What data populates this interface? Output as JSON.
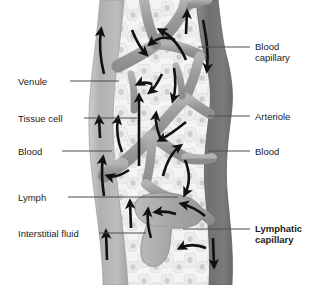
{
  "figure": {
    "background_color": "#ffffff",
    "width": 319,
    "height": 285
  },
  "palette": {
    "venule_fill": "#b3b3b3",
    "venule_edge": "#9a9a9a",
    "arteriole_fill": "#7d7d7d",
    "arteriole_edge": "#6a6a6a",
    "capillary_fill": "#9e9e9e",
    "lymphatic_fill": "#a8a8a8",
    "tissue_fill": "#f2f2f2",
    "tissue_edge": "#d8d8d8",
    "nucleus_fill": "#c9c9c9",
    "arrow_color": "#111111",
    "leader_color": "#4d4d4d",
    "text_color": "#1b1b1b"
  },
  "labels": {
    "left": [
      {
        "id": "venule",
        "text": "Venule",
        "bold": false,
        "x": 18,
        "y": 76,
        "leader_x1": 70,
        "leader_x2": 119,
        "leader_y": 81
      },
      {
        "id": "tissue-cell",
        "text": "Tissue cell",
        "bold": false,
        "x": 18,
        "y": 113,
        "leader_x1": 84,
        "leader_x2": 135,
        "leader_y": 118
      },
      {
        "id": "blood-left",
        "text": "Blood",
        "bold": false,
        "x": 18,
        "y": 146,
        "leader_x1": 62,
        "leader_x2": 112,
        "leader_y": 151
      },
      {
        "id": "lymph",
        "text": "Lymph",
        "bold": false,
        "x": 18,
        "y": 192,
        "leader_x1": 68,
        "leader_x2": 178,
        "leader_y": 197
      },
      {
        "id": "interstitial-fluid",
        "text": "Interstitial fluid",
        "bold": false,
        "x": 18,
        "y": 228,
        "leader_x1": 99,
        "leader_x2": 146,
        "leader_y": 233
      }
    ],
    "right": [
      {
        "id": "blood-capillary",
        "text": "Blood\ncapillary",
        "bold": false,
        "x": 255,
        "y": 41,
        "leader_x1": 198,
        "leader_x2": 248,
        "leader_y": 47
      },
      {
        "id": "arteriole",
        "text": "Arteriole",
        "bold": false,
        "x": 255,
        "y": 111,
        "leader_x1": 206,
        "leader_x2": 248,
        "leader_y": 116
      },
      {
        "id": "blood-right",
        "text": "Blood",
        "bold": false,
        "x": 255,
        "y": 146,
        "leader_x1": 206,
        "leader_x2": 248,
        "leader_y": 151
      },
      {
        "id": "lymphatic-capillary",
        "text": "Lymphatic\ncapillary",
        "bold": true,
        "x": 255,
        "y": 223,
        "leader_x1": 183,
        "leader_x2": 248,
        "leader_y": 229
      }
    ]
  },
  "flow_arrows": {
    "description": "Black directional arrows showing blood flow in vessels, fluid movement into interstitial space, and lymph flow into the lymphatic capillary",
    "count": 19
  }
}
